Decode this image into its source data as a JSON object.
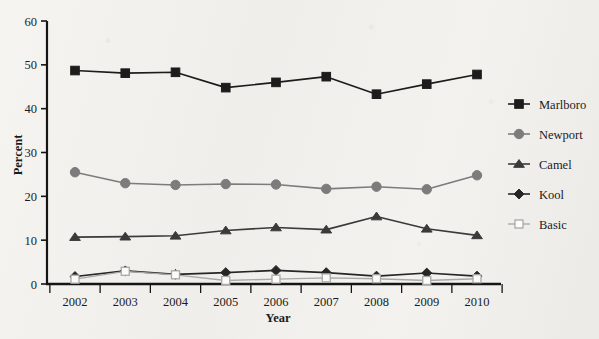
{
  "chart_data": {
    "type": "line",
    "title": "",
    "subtitle": "",
    "xlabel": "Year",
    "ylabel": "Percent",
    "categories": [
      "2002",
      "2003",
      "2004",
      "2005",
      "2006",
      "2007",
      "2008",
      "2009",
      "2010"
    ],
    "x": [
      2002,
      2003,
      2004,
      2005,
      2006,
      2007,
      2008,
      2009,
      2010
    ],
    "xlim": [
      2002,
      2010
    ],
    "ylim": [
      0,
      60
    ],
    "yticks": [
      0,
      10,
      20,
      30,
      40,
      50,
      60
    ],
    "ytick_labels": [
      "0",
      "10",
      "20",
      "30",
      "40",
      "50",
      "60"
    ],
    "grid": false,
    "legend_position": "right",
    "series": [
      {
        "name": "Marlboro",
        "marker": "square-filled",
        "color": "#1c1c1c",
        "values": [
          48.7,
          48.1,
          48.3,
          44.8,
          46.0,
          47.3,
          43.3,
          45.6,
          47.8
        ]
      },
      {
        "name": "Newport",
        "marker": "circle-filled",
        "color": "#7c7c7c",
        "values": [
          25.5,
          23.0,
          22.6,
          22.8,
          22.7,
          21.7,
          22.2,
          21.6,
          24.8
        ]
      },
      {
        "name": "Camel",
        "marker": "triangle-filled",
        "color": "#3a3a3a",
        "values": [
          10.7,
          10.8,
          11.0,
          12.2,
          12.9,
          12.4,
          15.4,
          12.6,
          11.1
        ]
      },
      {
        "name": "Kool",
        "marker": "diamond-filled",
        "color": "#262626",
        "values": [
          1.7,
          3.0,
          2.2,
          2.6,
          3.1,
          2.6,
          1.8,
          2.5,
          1.8
        ]
      },
      {
        "name": "Basic",
        "marker": "square-open",
        "color": "#a8a8a8",
        "values": [
          1.1,
          2.9,
          2.1,
          0.8,
          1.1,
          1.4,
          1.2,
          0.8,
          1.2
        ]
      }
    ]
  },
  "axes": {
    "y_title": "Percent",
    "x_title": "Year"
  },
  "legend": {
    "items": [
      {
        "label": "Marlboro"
      },
      {
        "label": "Newport"
      },
      {
        "label": "Camel"
      },
      {
        "label": "Kool"
      },
      {
        "label": "Basic"
      }
    ]
  },
  "colors": {
    "marlboro": "#1c1c1c",
    "newport": "#7c7c7c",
    "camel": "#3a3a3a",
    "kool": "#262626",
    "basic": "#a8a8a8",
    "axis": "#151515",
    "background": "#f2f1ee"
  }
}
